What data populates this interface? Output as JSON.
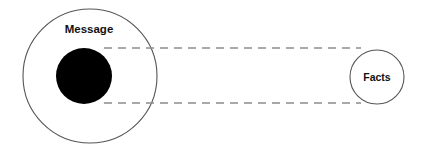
{
  "diagram": {
    "background_color": "#ffffff",
    "width": 429,
    "height": 153,
    "labels": {
      "message": "Message",
      "facts": "Facts"
    },
    "colors": {
      "outline_stroke": "#555555",
      "filled_circle": "#000000",
      "dashed_line": "#8c8c8c",
      "text": "#111111"
    },
    "shapes": {
      "outer_circle": {
        "name": "message-outer-circle",
        "cx": 90,
        "cy": 76,
        "r": 67,
        "fill": "none",
        "stroke_width": 1.1
      },
      "inner_circle": {
        "name": "message-filled-circle",
        "cx": 84,
        "cy": 76,
        "r": 28,
        "fill": "#000000"
      },
      "facts_circle": {
        "name": "facts-circle",
        "cx": 377,
        "cy": 77,
        "r": 27,
        "fill": "none",
        "stroke_width": 1.1
      },
      "top_dashed_line": {
        "name": "top-projection-line",
        "x1": 104,
        "y1": 48,
        "x2": 361,
        "y2": 48,
        "dash": "8 6",
        "stroke_width": 1.6
      },
      "bottom_dashed_line": {
        "name": "bottom-projection-line",
        "x1": 104,
        "y1": 103,
        "x2": 361,
        "y2": 103,
        "dash": "8 6",
        "stroke_width": 1.6
      }
    },
    "text_positions": {
      "message": {
        "x": 89,
        "y": 33,
        "font_size": 11.5
      },
      "facts": {
        "x": 377,
        "y": 81,
        "font_size": 10.5
      }
    }
  }
}
